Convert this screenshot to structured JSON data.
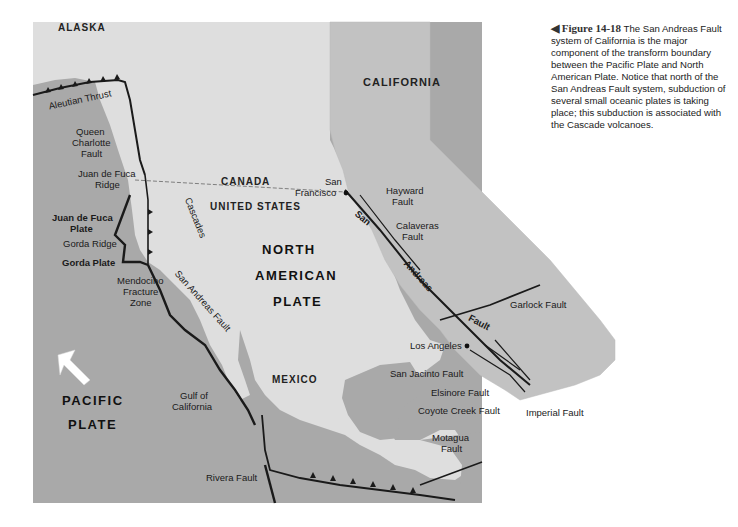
{
  "caption": {
    "marker": "◀",
    "figure_label": "Figure 14-18",
    "text": "The San Andreas Fault system of California is the major component of the transform boundary between the Pacific Plate and North American Plate. Notice that north of the San Andreas Fault system, subduction of several small oceanic plates is taking place; this subduction is associated with the Cascade volcanoes."
  },
  "colors": {
    "ocean": "#a9a9a9",
    "land": "#dedede",
    "california": "#c2c2c2",
    "fault_line": "#1a1a1a",
    "arrow": "#ffffff"
  },
  "regions": {
    "alaska": "ALASKA",
    "canada": "CANADA",
    "united_states": "UNITED STATES",
    "mexico": "MEXICO",
    "california": "CALIFORNIA"
  },
  "plates": {
    "north_american": [
      "NORTH",
      "AMERICAN",
      "PLATE"
    ],
    "pacific": [
      "PACIFIC",
      "PLATE"
    ],
    "juan_de_fuca": [
      "Juan de Fuca",
      "Plate"
    ],
    "gorda": "Gorda Plate"
  },
  "features": {
    "aleutian_thrust": "Aleutian Thrust",
    "queen_charlotte": [
      "Queen",
      "Charlotte",
      "Fault"
    ],
    "juan_de_fuca_ridge": [
      "Juan de Fuca",
      "Ridge"
    ],
    "gorda_ridge": "Gorda Ridge",
    "mendocino": [
      "Mendocino",
      "Fracture",
      "Zone"
    ],
    "cascades": "Cascades",
    "san_andreas_fault": "San Andreas Fault",
    "gulf_of_california": [
      "Gulf of",
      "California"
    ],
    "rivera_fault": "Rivera Fault",
    "motagua_fault": [
      "Motagua",
      "Fault"
    ]
  },
  "california_inset": {
    "san_francisco": [
      "San",
      "Francisco"
    ],
    "hayward": [
      "Hayward",
      "Fault"
    ],
    "calaveras": [
      "Calaveras",
      "Fault"
    ],
    "san": "San",
    "andreas": "Andreas",
    "fault": "Fault",
    "garlock": "Garlock Fault",
    "los_angeles": "Los Angeles",
    "san_jacinto": "San Jacinto Fault",
    "elsinore": "Elsinore Fault",
    "coyote_creek": "Coyote Creek Fault",
    "imperial": "Imperial Fault"
  }
}
